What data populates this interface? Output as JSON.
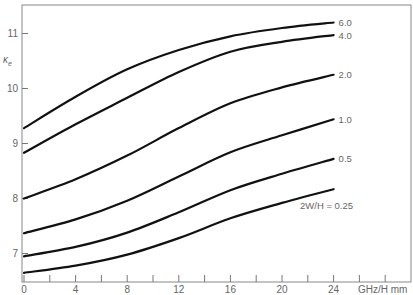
{
  "chart_data": {
    "type": "line",
    "title": "",
    "xlabel": "GHz/H mm",
    "ylabel": "κe",
    "ylabel_main": "κ",
    "ylabel_sub": "e",
    "xlim": [
      0,
      29.5
    ],
    "ylim": [
      6.45,
      11.5
    ],
    "x_ticks": [
      0,
      2,
      4,
      6,
      8,
      10,
      12,
      14,
      16,
      18,
      20,
      22,
      24,
      26,
      28
    ],
    "x_tick_labels": {
      "0": "0",
      "4": "4",
      "8": "8",
      "12": "12",
      "16": "16",
      "20": "20",
      "24": "24"
    },
    "y_ticks": [
      7,
      8,
      9,
      10,
      11
    ],
    "y_tick_labels": [
      "7",
      "8",
      "9",
      "10",
      "11"
    ],
    "grid": false,
    "legend": "inline labels at curve ends",
    "x": [
      0,
      4,
      8,
      12,
      16,
      20,
      24
    ],
    "series": [
      {
        "name": "6.0",
        "label": "6.0",
        "values": [
          9.28,
          9.85,
          10.35,
          10.7,
          10.95,
          11.1,
          11.2
        ]
      },
      {
        "name": "4.0",
        "label": "4.0",
        "values": [
          8.83,
          9.35,
          9.83,
          10.3,
          10.67,
          10.85,
          10.97
        ]
      },
      {
        "name": "2.0",
        "label": "2.0",
        "values": [
          8.0,
          8.35,
          8.78,
          9.28,
          9.73,
          10.02,
          10.25
        ]
      },
      {
        "name": "1.0",
        "label": "1.0",
        "values": [
          7.37,
          7.62,
          7.96,
          8.4,
          8.84,
          9.15,
          9.44
        ]
      },
      {
        "name": "0.5",
        "label": "0.5",
        "values": [
          6.95,
          7.12,
          7.38,
          7.75,
          8.15,
          8.45,
          8.72
        ]
      },
      {
        "name": "0.25",
        "label": "2W/H = 0.25",
        "values": [
          6.65,
          6.78,
          6.98,
          7.28,
          7.64,
          7.92,
          8.17
        ]
      }
    ]
  }
}
